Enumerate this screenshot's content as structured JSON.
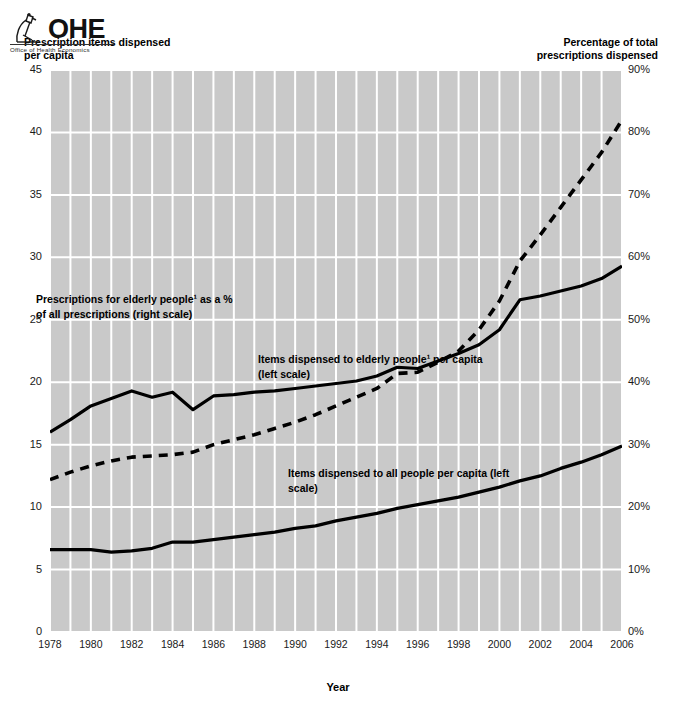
{
  "figure": {
    "left_axis_title": "Prescription items dispensed\nper capita",
    "right_axis_title": "Percentage of total\nprescriptions dispensed",
    "x_axis_title": "Year",
    "logo": {
      "wordmark": "OHE",
      "tagline": "Office of Health Economics",
      "icon": "microscope-icon"
    }
  },
  "annotations": {
    "elderly_percentage": "Prescriptions for elderly people¹ as a %\nof all prescriptions (right scale)",
    "elderly_items": "Items dispensed to elderly people¹ per capita\n(left scale)",
    "all_items": "Items dispensed to all people per capita (left\nscale)"
  },
  "chart_data": {
    "type": "line",
    "title": "",
    "xlabel": "Year",
    "ylabel": "Prescription items dispensed per capita",
    "y2label": "Percentage of total prescriptions dispensed",
    "xlim": [
      1978,
      2006
    ],
    "ylim": [
      0,
      45
    ],
    "y2lim": [
      0,
      90
    ],
    "grid": true,
    "legend": "annotations-inline",
    "y_ticks": [
      0,
      5,
      10,
      15,
      20,
      25,
      30,
      35,
      40,
      45
    ],
    "y2_ticks": [
      "0%",
      "10%",
      "20%",
      "30%",
      "40%",
      "50%",
      "60%",
      "70%",
      "80%",
      "90%"
    ],
    "x_ticks": [
      1978,
      1980,
      1982,
      1984,
      1986,
      1988,
      1990,
      1992,
      1994,
      1996,
      1998,
      2000,
      2002,
      2004,
      2006
    ],
    "x": [
      1978,
      1979,
      1980,
      1981,
      1982,
      1983,
      1984,
      1985,
      1986,
      1987,
      1988,
      1989,
      1990,
      1991,
      1992,
      1993,
      1994,
      1995,
      1996,
      1997,
      1998,
      1999,
      2000,
      2001,
      2002,
      2003,
      2004,
      2005,
      2006
    ],
    "series": [
      {
        "name": "Prescriptions for elderly people as a % of all prescriptions (right scale)",
        "axis": "right",
        "style": "solid",
        "color": "#000000",
        "units": "%",
        "values": [
          32.0,
          34.0,
          36.2,
          37.4,
          38.6,
          37.6,
          38.4,
          35.6,
          37.8,
          38.0,
          38.4,
          38.6,
          39.0,
          39.4,
          39.8,
          40.2,
          41.0,
          42.4,
          42.2,
          43.4,
          44.6,
          46.0,
          48.4,
          53.2,
          53.8,
          54.6,
          55.4,
          56.6,
          58.6
        ]
      },
      {
        "name": "Items dispensed to elderly people per capita (left scale)",
        "axis": "left",
        "style": "dashed",
        "color": "#000000",
        "units": "items",
        "values": [
          12.2,
          12.8,
          13.3,
          13.7,
          14.0,
          14.1,
          14.2,
          14.4,
          15.0,
          15.4,
          15.8,
          16.3,
          16.8,
          17.4,
          18.1,
          18.8,
          19.5,
          20.7,
          20.8,
          21.6,
          22.5,
          24.2,
          26.5,
          29.7,
          31.8,
          34.0,
          36.2,
          38.4,
          41.0
        ]
      },
      {
        "name": "Items dispensed to all people per capita (left scale)",
        "axis": "left",
        "style": "solid",
        "color": "#000000",
        "units": "items",
        "values": [
          6.6,
          6.6,
          6.6,
          6.4,
          6.5,
          6.7,
          7.2,
          7.2,
          7.4,
          7.6,
          7.8,
          8.0,
          8.3,
          8.5,
          8.9,
          9.2,
          9.5,
          9.9,
          10.2,
          10.5,
          10.8,
          11.2,
          11.6,
          12.1,
          12.5,
          13.1,
          13.6,
          14.2,
          14.9
        ]
      }
    ]
  }
}
